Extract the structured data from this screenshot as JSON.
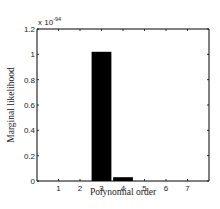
{
  "chart_data": {
    "type": "bar",
    "title": "",
    "xlabel": "Polynomial order",
    "ylabel": "Marginal likelihood",
    "y_multiplier": "x 10",
    "y_exponent": "-94",
    "categories": [
      "1",
      "2",
      "3",
      "4",
      "5",
      "6",
      "7"
    ],
    "values": [
      0,
      0,
      1.02,
      0.03,
      0,
      0,
      0
    ],
    "xlim": [
      0,
      8
    ],
    "ylim": [
      0,
      1.2
    ],
    "yticks": [
      "0",
      "0.2",
      "0.4",
      "0.6",
      "0.8",
      "1",
      "1.2"
    ],
    "yticks_values": [
      0,
      0.2,
      0.4,
      0.6,
      0.8,
      1.0,
      1.2
    ],
    "grid": false,
    "legend": null,
    "bar_color": "#000000"
  }
}
